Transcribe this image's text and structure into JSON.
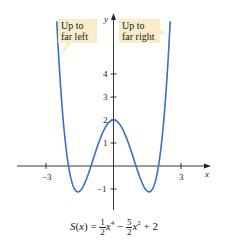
{
  "chart_data": {
    "type": "line",
    "title": "",
    "function": "S(x) = 1/2 x^4 - 5/2 x^2 + 2",
    "xlabel": "x",
    "ylabel": "y",
    "x_ticks": [
      -3,
      3
    ],
    "x_tick_labels": [
      "−3",
      "3"
    ],
    "y_ticks": [
      -1,
      1,
      2,
      3,
      4
    ],
    "y_tick_labels": [
      "−1",
      "1",
      "2",
      "3",
      "4"
    ],
    "xlim": [
      -4.2,
      4.3
    ],
    "ylim": [
      -1.9,
      6.7
    ],
    "grid": false,
    "legend": null,
    "series": [
      {
        "name": "S(x)",
        "color": "#3a6fc4",
        "x": [
          -2.52,
          -2.25,
          -2.0,
          -1.75,
          -1.58,
          -1.5,
          -1.25,
          -1.0,
          -0.75,
          -0.5,
          -0.25,
          0,
          0.25,
          0.5,
          0.75,
          1.0,
          1.25,
          1.5,
          1.58,
          1.75,
          2.0,
          2.25,
          2.52
        ],
        "y": [
          6.3,
          3.47,
          0.0,
          -0.97,
          -1.125,
          -1.09,
          -0.44,
          0.0,
          0.75,
          1.41,
          1.85,
          2.0,
          1.85,
          1.41,
          0.75,
          0.0,
          -0.44,
          -1.09,
          -1.125,
          -0.97,
          0.0,
          3.47,
          6.3
        ]
      }
    ],
    "key_points": {
      "y_intercept": [
        0,
        2
      ],
      "local_max": [
        0,
        2
      ],
      "local_mins": [
        [
          -1.58,
          -1.125
        ],
        [
          1.58,
          -1.125
        ]
      ],
      "x_intercepts": [
        -2,
        -1,
        1,
        2
      ]
    },
    "annotations": [
      {
        "text": "Up to far left",
        "lines": [
          "Up to",
          "far left"
        ],
        "points_to": "left arm of curve"
      },
      {
        "text": "Up to far right",
        "lines": [
          "Up to",
          "far right"
        ],
        "points_to": "right arm of curve"
      }
    ]
  },
  "labels": {
    "x_axis": "x",
    "y_axis": "y",
    "tick_neg3": "−3",
    "tick_3": "3",
    "tick_4": "4",
    "tick_3y": "3",
    "tick_2": "2",
    "tick_1": "1",
    "tick_neg1": "−1"
  },
  "callouts": {
    "left": {
      "line1": "Up to",
      "line2": "far left"
    },
    "right": {
      "line1": "Up to",
      "line2": "far right"
    }
  },
  "formula": {
    "lhs": "S(x) = ",
    "frac1_num": "1",
    "frac1_den": "2",
    "term1": "x",
    "exp1": "4",
    "minus": " − ",
    "frac2_num": "5",
    "frac2_den": "2",
    "term2": "x",
    "exp2": "2",
    "tail": " + 2"
  },
  "colors": {
    "curve": "#3a6fc4",
    "callout_fill": "#f8ecc9",
    "axis": "#222222"
  }
}
